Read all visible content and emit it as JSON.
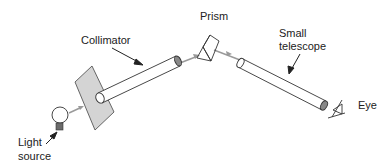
{
  "diagram": {
    "type": "spectroscope-schematic",
    "labels": {
      "collimator": "Collimator",
      "prism": "Prism",
      "telescope_line1": "Small",
      "telescope_line2": "telescope",
      "eye": "Eye",
      "light_line1": "Light",
      "light_line2": "source"
    },
    "colors": {
      "stroke": "#333333",
      "plate_fill": "#d4d4d4",
      "tube_fill": "#ffffff",
      "ray": "#9a9a9a",
      "bulb_base": "#6b6b6b"
    }
  }
}
